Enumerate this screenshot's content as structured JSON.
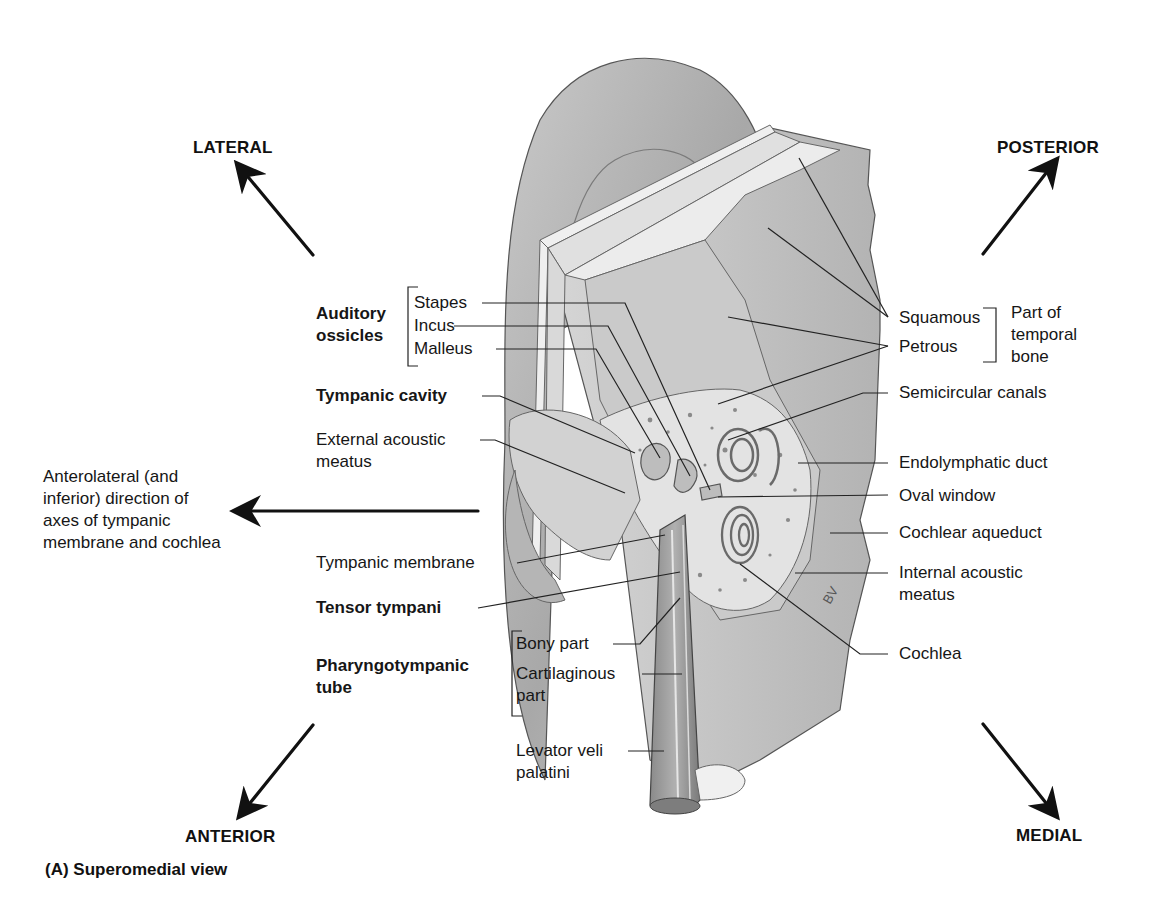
{
  "directions": {
    "lateral": "LATERAL",
    "posterior": "POSTERIOR",
    "anterior": "ANTERIOR",
    "medial": "MEDIAL"
  },
  "caption": "(A) Superomedial view",
  "axis_note": [
    "Anterolateral (and",
    "inferior) direction of",
    "axes of tympanic",
    "membrane and cochlea"
  ],
  "left_labels": {
    "auditory_ossicles_group": [
      "Auditory",
      "ossicles"
    ],
    "stapes": "Stapes",
    "incus": "Incus",
    "malleus": "Malleus",
    "tympanic_cavity": "Tympanic cavity",
    "external_acoustic_meatus": [
      "External acoustic",
      "meatus"
    ],
    "tympanic_membrane": "Tympanic membrane",
    "tensor_tympani": "Tensor tympani",
    "pharyngotympanic_tube_group": [
      "Pharyngotympanic",
      "tube"
    ],
    "bony_part": "Bony part",
    "cartilaginous_part": [
      "Cartilaginous",
      "part"
    ],
    "levator_veli_palatini": [
      "Levator veli",
      "palatini"
    ]
  },
  "right_labels": {
    "squamous": "Squamous",
    "petrous": "Petrous",
    "temporal_bone_group": [
      "Part of",
      "temporal",
      "bone"
    ],
    "semicircular_canals": "Semicircular canals",
    "endolymphatic_duct": "Endolymphatic duct",
    "oval_window": "Oval window",
    "cochlear_aqueduct": "Cochlear aqueduct",
    "internal_acoustic_meatus": [
      "Internal acoustic",
      "meatus"
    ],
    "cochlea": "Cochlea"
  },
  "artist_signature": "BV",
  "colors": {
    "ink": "#111111",
    "bone_light": "#e4e4e4",
    "bone_mid": "#bdbdbd",
    "bone_dark": "#8e8e8e",
    "leader": "#222222"
  }
}
